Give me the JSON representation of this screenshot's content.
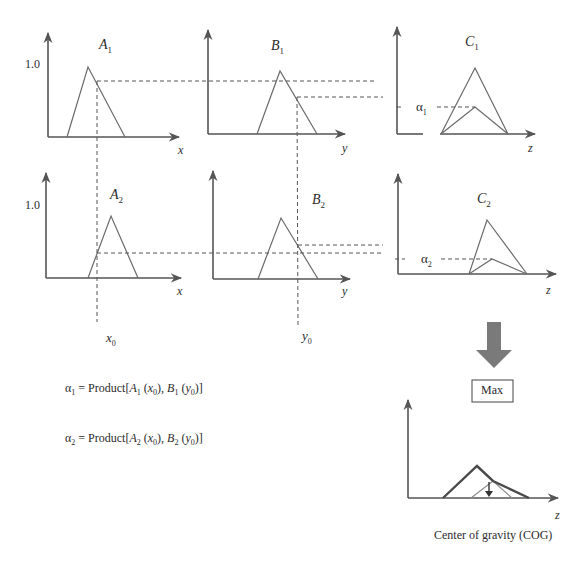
{
  "colors": {
    "axis": "#555555",
    "membership": "#6a6a6a",
    "arrow_fill": "#7a7a7a",
    "background": "#ffffff"
  },
  "plots": {
    "A1": {
      "title": "A",
      "sub": "1",
      "ylabel_tick": "1.0",
      "xlabel": "x"
    },
    "B1": {
      "title": "B",
      "sub": "1",
      "xlabel": "y"
    },
    "C1": {
      "title": "C",
      "sub": "1",
      "alpha": "α",
      "alpha_sub": "1",
      "xlabel": "z"
    },
    "A2": {
      "title": "A",
      "sub": "2",
      "ylabel_tick": "1.0",
      "xlabel": "x"
    },
    "B2": {
      "title": "B",
      "sub": "2",
      "xlabel": "y"
    },
    "C2": {
      "title": "C",
      "sub": "2",
      "alpha": "α",
      "alpha_sub": "2",
      "xlabel": "z"
    },
    "result": {
      "xlabel": "z",
      "caption": "Center of gravity (COG)"
    }
  },
  "inputs": {
    "x0": {
      "var": "x",
      "sub": "0"
    },
    "y0": {
      "var": "y",
      "sub": "0"
    }
  },
  "operator_box": {
    "label": "Max"
  },
  "equations": [
    {
      "alpha": "α",
      "alpha_sub": "1",
      "eq": " = Product[",
      "A": "A",
      "A_sub": "1",
      "x": "x",
      "x_sub": "0",
      "sep": "), ",
      "B": "B",
      "B_sub": "1",
      "y": "y",
      "y_sub": "0",
      "end": ")]"
    },
    {
      "alpha": "α",
      "alpha_sub": "2",
      "eq": " = Product[",
      "A": "A",
      "A_sub": "2",
      "x": "x",
      "x_sub": "0",
      "sep": "), ",
      "B": "B",
      "B_sub": "2",
      "y": "y",
      "y_sub": "0",
      "end": ")]"
    }
  ]
}
